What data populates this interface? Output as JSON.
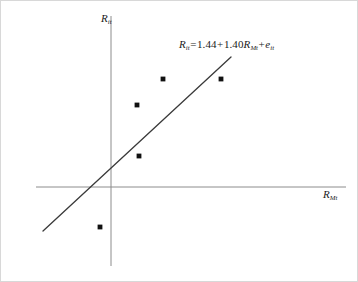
{
  "figure": {
    "background_color": "#ffffff",
    "border_color": "#d8d8d8",
    "axis_color": "#8c8c8c",
    "line_color": "#3a3a3a",
    "point_color": "#111111",
    "text_color": "#1a1a1a"
  },
  "labels": {
    "y_axis_base": "R",
    "y_axis_sub": "it",
    "x_axis_base": "R",
    "x_axis_sub": "Mt"
  },
  "equation": {
    "lhs_base": "R",
    "lhs_sub": "it",
    "equals": "=",
    "intercept": "1.44",
    "plus1": "+",
    "slope": "1.40",
    "slope_var_base": "R",
    "slope_var_sub": "Mt",
    "plus2": "+",
    "error_base": "e",
    "error_sub": "it",
    "full_text": "Rit = 1.44+1.40RMt+eit"
  },
  "chart_data": {
    "type": "scatter",
    "title": "",
    "xlabel": "R_Mt",
    "ylabel": "R_it",
    "grid": false,
    "legend": null,
    "axes_style": "centered-cross",
    "axis_origin_px": {
      "x": 110,
      "y": 186
    },
    "y_axis_extent_px": {
      "top": 15,
      "bottom": 265
    },
    "x_axis_extent_px": {
      "left": 35,
      "right": 345
    },
    "points_px": [
      {
        "x": 162,
        "y": 78
      },
      {
        "x": 220,
        "y": 78
      },
      {
        "x": 136,
        "y": 104
      },
      {
        "x": 138,
        "y": 155
      },
      {
        "x": 99,
        "y": 226
      }
    ],
    "regression_line_px": {
      "x1": 42,
      "y1": 230,
      "x2": 230,
      "y2": 56
    },
    "regression": {
      "intercept": 1.44,
      "slope": 1.4,
      "equation": "R_it = 1.44 + 1.40 R_Mt + e_it"
    }
  }
}
